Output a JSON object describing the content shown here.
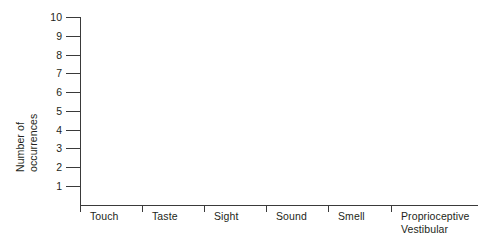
{
  "chart_data": {
    "type": "bar",
    "title": "",
    "subtitle": "",
    "xlabel": "",
    "ylabel": "Number of occurrences",
    "ylabel_lines": [
      "Number of",
      "occurrences"
    ],
    "categories": [
      "Touch",
      "Taste",
      "Sight",
      "Sound",
      "Smell",
      "Proprioceptive Vestibular"
    ],
    "category_lines": [
      [
        "Touch"
      ],
      [
        "Taste"
      ],
      [
        "Sight"
      ],
      [
        "Sound"
      ],
      [
        "Smell"
      ],
      [
        "Proprioceptive",
        "Vestibular"
      ]
    ],
    "values": [
      0,
      0,
      0,
      0,
      0,
      0
    ],
    "ylim": [
      0,
      10
    ],
    "ytick_labels": [
      "10",
      "9",
      "8",
      "7",
      "6",
      "5",
      "4",
      "3",
      "2",
      "1"
    ],
    "ytick_values": [
      10,
      9,
      8,
      7,
      6,
      5,
      4,
      3,
      2,
      1
    ],
    "grid": false,
    "legend": false,
    "legend_position": "none",
    "annotations": [],
    "axis_color": "#3a3a3a",
    "text_color": "#231f20",
    "background_color": "#ffffff",
    "note": "Blank data-collection template: axes drawn, no bars plotted"
  }
}
